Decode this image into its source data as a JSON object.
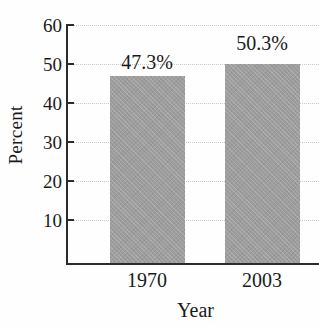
{
  "chart_data": {
    "type": "bar",
    "title": "",
    "title_cropped": true,
    "categories": [
      "1970",
      "2003"
    ],
    "values": [
      47.3,
      50.3
    ],
    "data_labels": [
      "47.3%",
      "50.3%"
    ],
    "xlabel": "Year",
    "ylabel": "Percent",
    "ylim": [
      0,
      60
    ],
    "yticks": [
      60,
      50,
      40,
      30,
      20,
      10
    ],
    "ytick_labels": [
      "60",
      "50",
      "40",
      "30",
      "20",
      "10"
    ],
    "grid": true,
    "grid_style": "dotted-horizontal",
    "legend": null,
    "bar_color": "#9d9d9d",
    "axis_color": "#2b2b2b",
    "grid_color": "#c9c9c9"
  }
}
